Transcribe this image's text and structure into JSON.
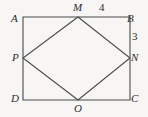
{
  "figure": {
    "kind": "plane-geometry-diagram",
    "background_color": "#f7f6f4",
    "stroke_color": "#4a4a4a",
    "text_color": "#2b2b2b",
    "rectangle": {
      "name": "ABCD",
      "corners": {
        "A": {
          "label": "A",
          "x": 23,
          "y": 17
        },
        "B": {
          "label": "B",
          "x": 130,
          "y": 17
        },
        "C": {
          "label": "C",
          "x": 130,
          "y": 100
        },
        "D": {
          "label": "D",
          "x": 23,
          "y": 100
        }
      }
    },
    "rhombus": {
      "name": "MNOP",
      "vertices": {
        "M": {
          "label": "M",
          "x": 78,
          "y": 17,
          "on_side": "AB"
        },
        "N": {
          "label": "N",
          "x": 130,
          "y": 58,
          "on_side": "BC"
        },
        "O": {
          "label": "O",
          "x": 78,
          "y": 100,
          "on_side": "DC"
        },
        "P": {
          "label": "P",
          "x": 23,
          "y": 58,
          "on_side": "AD"
        }
      }
    },
    "measurements": [
      {
        "id": "MB",
        "value": "4",
        "segment": "M to B",
        "x": 103,
        "y": 8
      },
      {
        "id": "BN",
        "value": "3",
        "segment": "B to N",
        "x": 135,
        "y": 38
      }
    ]
  }
}
